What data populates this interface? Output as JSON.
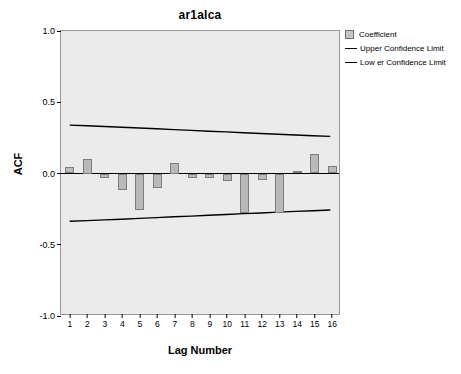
{
  "chart_data": {
    "type": "bar",
    "title": "ar1alca",
    "xlabel": "Lag Number",
    "ylabel": "ACF",
    "categories": [
      1,
      2,
      3,
      4,
      5,
      6,
      7,
      8,
      9,
      10,
      11,
      12,
      13,
      14,
      15,
      16
    ],
    "values": [
      0.045,
      0.1,
      -0.035,
      -0.115,
      -0.255,
      -0.105,
      0.075,
      -0.035,
      -0.035,
      -0.055,
      -0.275,
      -0.045,
      -0.28,
      0.02,
      0.14,
      0.055
    ],
    "series": [
      {
        "name": "Coefficient",
        "type": "bar",
        "values": [
          0.045,
          0.1,
          -0.035,
          -0.115,
          -0.255,
          -0.105,
          0.075,
          -0.035,
          -0.035,
          -0.055,
          -0.275,
          -0.045,
          -0.28,
          0.02,
          0.14,
          0.055
        ]
      },
      {
        "name": "Upper Confidence Limit",
        "type": "line",
        "values": [
          0.335,
          0.33,
          0.325,
          0.32,
          0.314,
          0.309,
          0.303,
          0.298,
          0.292,
          0.287,
          0.281,
          0.276,
          0.27,
          0.265,
          0.26,
          0.255
        ]
      },
      {
        "name": "Lower Confidence Limit",
        "type": "line",
        "values": [
          -0.345,
          -0.34,
          -0.335,
          -0.33,
          -0.324,
          -0.319,
          -0.313,
          -0.308,
          -0.302,
          -0.297,
          -0.291,
          -0.286,
          -0.28,
          -0.275,
          -0.27,
          -0.265
        ]
      }
    ],
    "yticks": [
      "1.0",
      "0.5",
      "0.0",
      "-0.5",
      "-1.0"
    ],
    "ytick_values": [
      1.0,
      0.5,
      0.0,
      -0.5,
      -1.0
    ],
    "ylim": [
      -1.0,
      1.0
    ],
    "xlim": [
      0.5,
      16.5
    ],
    "grid": false,
    "legend_position": "top-right",
    "plot_background": "#ebebeb",
    "bar_fill": "#b9b9b9",
    "bar_edge": "#7d7d7d",
    "line_color": "#000000"
  },
  "legend": {
    "items": [
      {
        "label": "Coefficient",
        "marker": "box"
      },
      {
        "label": "Upper Confidence Limit",
        "marker": "line"
      },
      {
        "label": "Low er Confidence Limit",
        "marker": "line"
      }
    ]
  }
}
